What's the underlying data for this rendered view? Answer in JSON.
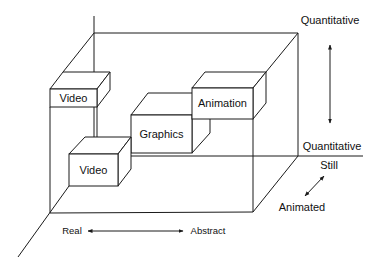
{
  "diagram": {
    "type": "3d-media-space",
    "axes": {
      "vertical": {
        "top_label": "Quantitative",
        "bottom_label": "Quantitative"
      },
      "depth": {
        "back_label": "Still",
        "front_label": "Animated"
      },
      "horizontal": {
        "left_label": "Real",
        "right_label": "Abstract"
      }
    },
    "boxes": [
      {
        "id": "video-upper",
        "label": "Video"
      },
      {
        "id": "video-lower",
        "label": "Video"
      },
      {
        "id": "graphics",
        "label": "Graphics"
      },
      {
        "id": "animation",
        "label": "Animation"
      }
    ],
    "colors": {
      "line": "#1a1a1a",
      "background": "#ffffff"
    }
  }
}
